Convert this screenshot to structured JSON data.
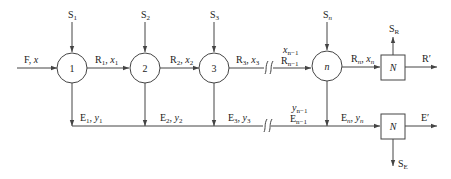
{
  "diagram": {
    "feed": {
      "main": "F",
      "var": "x"
    },
    "stages": [
      {
        "id": "1",
        "solvent": {
          "main": "S",
          "sub": "1"
        },
        "raffinate": {
          "main": "R",
          "sub": "1",
          "var": "x",
          "var_sub": "1"
        },
        "extract": {
          "main": "E",
          "sub": "1",
          "var": "y",
          "var_sub": "1"
        }
      },
      {
        "id": "2",
        "solvent": {
          "main": "S",
          "sub": "2"
        },
        "raffinate": {
          "main": "R",
          "sub": "2",
          "var": "x",
          "var_sub": "2"
        },
        "extract": {
          "main": "E",
          "sub": "2",
          "var": "y",
          "var_sub": "2"
        }
      },
      {
        "id": "3",
        "solvent": {
          "main": "S",
          "sub": "3"
        },
        "raffinate": {
          "main": "R",
          "sub": "3",
          "var": "x",
          "var_sub": "3"
        },
        "extract": {
          "main": "E",
          "sub": "3",
          "var": "y",
          "var_sub": "3"
        }
      },
      {
        "id": "n",
        "solvent": {
          "main": "S",
          "sub": "n"
        },
        "raffinate": {
          "main": "R",
          "sub": "n",
          "var": "x",
          "var_sub": "n"
        },
        "extract": {
          "main": "E",
          "sub": "n",
          "var": "y",
          "var_sub": "n"
        }
      }
    ],
    "prev_raffinate": {
      "main": "R",
      "sub": "n−1",
      "var": "x",
      "var_sub": "n−1"
    },
    "prev_extract": {
      "main": "E",
      "sub": "n−1",
      "var": "y",
      "var_sub": "n−1"
    },
    "raffinate_recovery": {
      "label": "N",
      "solvent_out": {
        "main": "S",
        "sub": "R"
      },
      "product": "R′"
    },
    "extract_recovery": {
      "label": "N",
      "solvent_out": {
        "main": "S",
        "sub": "E"
      },
      "product": "E′"
    }
  }
}
